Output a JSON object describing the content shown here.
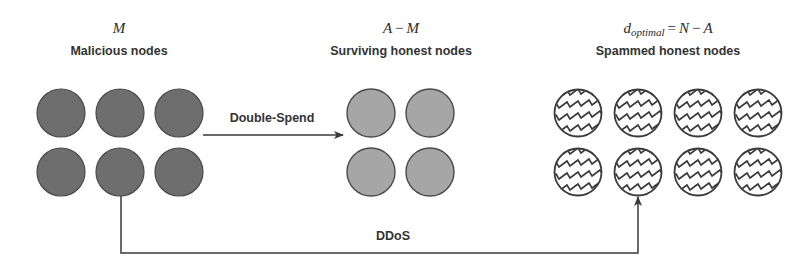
{
  "groups": {
    "malicious": {
      "math": "M",
      "title": "Malicious nodes",
      "count": 6,
      "fill": "#6e6e6e"
    },
    "surviving": {
      "math_left": "A",
      "math_op": "−",
      "math_right": "M",
      "title": "Surviving honest nodes",
      "count": 4,
      "fill": "#a6a6a6"
    },
    "spammed": {
      "math_var": "d",
      "math_sub": "optimal",
      "math_eq": "=",
      "math_left": "N",
      "math_op": "−",
      "math_right": "A",
      "title": "Spammed honest nodes",
      "count": 8,
      "fill": "#ffffff",
      "pattern": "zigzag-hatch"
    }
  },
  "edges": {
    "double_spend": {
      "label": "Double-Spend",
      "from": "malicious",
      "to": "surviving"
    },
    "ddos": {
      "label": "DDoS",
      "from": "malicious",
      "to": "spammed"
    }
  },
  "colors": {
    "stroke": "#3a3a3a",
    "arrow": "#3a3a3a"
  }
}
